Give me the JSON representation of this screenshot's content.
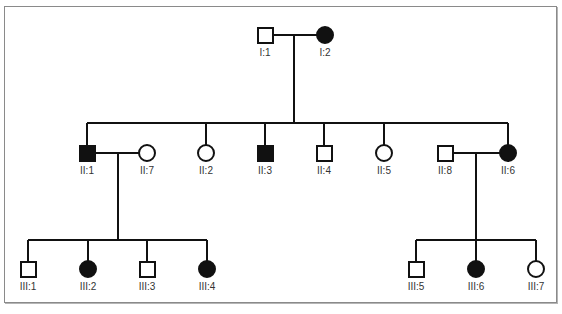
{
  "diagram": {
    "type": "pedigree",
    "colors": {
      "line": "#111111",
      "affected": "#111111",
      "unaffected": "#ffffff",
      "frame": "#8a8a8a"
    },
    "individuals": [
      {
        "id": "I:1",
        "sex": "male",
        "affected": false,
        "generation": 1
      },
      {
        "id": "I:2",
        "sex": "female",
        "affected": true,
        "generation": 1
      },
      {
        "id": "II:1",
        "sex": "male",
        "affected": true,
        "generation": 2
      },
      {
        "id": "II:7",
        "sex": "female",
        "affected": false,
        "generation": 2
      },
      {
        "id": "II:2",
        "sex": "female",
        "affected": false,
        "generation": 2
      },
      {
        "id": "II:3",
        "sex": "male",
        "affected": true,
        "generation": 2
      },
      {
        "id": "II:4",
        "sex": "male",
        "affected": false,
        "generation": 2
      },
      {
        "id": "II:5",
        "sex": "female",
        "affected": false,
        "generation": 2
      },
      {
        "id": "II:8",
        "sex": "male",
        "affected": false,
        "generation": 2
      },
      {
        "id": "II:6",
        "sex": "female",
        "affected": true,
        "generation": 2
      },
      {
        "id": "III:1",
        "sex": "male",
        "affected": false,
        "generation": 3
      },
      {
        "id": "III:2",
        "sex": "female",
        "affected": true,
        "generation": 3
      },
      {
        "id": "III:3",
        "sex": "male",
        "affected": false,
        "generation": 3
      },
      {
        "id": "III:4",
        "sex": "female",
        "affected": true,
        "generation": 3
      },
      {
        "id": "III:5",
        "sex": "male",
        "affected": false,
        "generation": 3
      },
      {
        "id": "III:6",
        "sex": "female",
        "affected": true,
        "generation": 3
      },
      {
        "id": "III:7",
        "sex": "female",
        "affected": false,
        "generation": 3
      }
    ],
    "matings": [
      {
        "partners": [
          "I:1",
          "I:2"
        ],
        "children": [
          "II:1",
          "II:2",
          "II:3",
          "II:4",
          "II:5",
          "II:6"
        ]
      },
      {
        "partners": [
          "II:1",
          "II:7"
        ],
        "children": [
          "III:1",
          "III:2",
          "III:3",
          "III:4"
        ]
      },
      {
        "partners": [
          "II:8",
          "II:6"
        ],
        "children": [
          "III:5",
          "III:6",
          "III:7"
        ]
      }
    ],
    "labels": {
      "I1": "I:1",
      "I2": "I:2",
      "II1": "II:1",
      "II7": "II:7",
      "II2": "II:2",
      "II3": "II:3",
      "II4": "II:4",
      "II5": "II:5",
      "II8": "II:8",
      "II6": "II:6",
      "III1": "III:1",
      "III2": "III:2",
      "III3": "III:3",
      "III4": "III:4",
      "III5": "III:5",
      "III6": "III:6",
      "III7": "III:7"
    }
  }
}
